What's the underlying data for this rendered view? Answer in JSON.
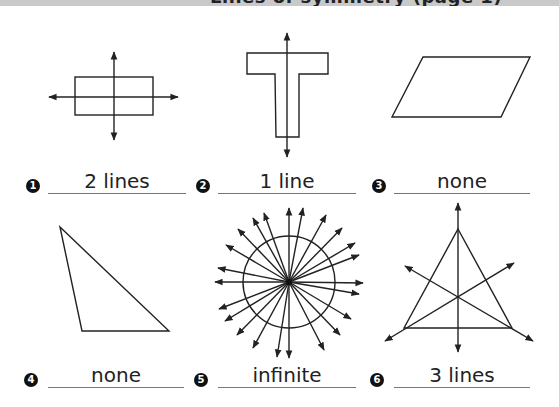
{
  "header": {
    "title": "Lines of symmetry (page 1)"
  },
  "problems": [
    {
      "number": "1",
      "shape": "rectangle",
      "answer": "2 lines"
    },
    {
      "number": "2",
      "shape": "T-shape",
      "answer": "1 line"
    },
    {
      "number": "3",
      "shape": "parallelogram",
      "answer": "none"
    },
    {
      "number": "4",
      "shape": "scalene triangle",
      "answer": "none"
    },
    {
      "number": "5",
      "shape": "circle",
      "answer": "infinite"
    },
    {
      "number": "6",
      "shape": "equilateral triangle",
      "answer": "3 lines"
    }
  ],
  "colors": {
    "ink": "#222222",
    "band": "#c9c9c9",
    "underline": "#777777"
  }
}
